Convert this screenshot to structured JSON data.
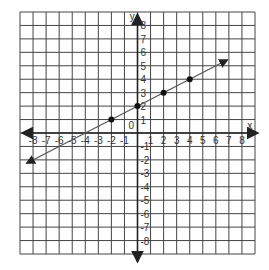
{
  "chart_data": {
    "type": "line",
    "title": "",
    "xlabel": "x",
    "ylabel": "y",
    "xlim": [
      -9,
      9
    ],
    "ylim": [
      -9,
      9
    ],
    "grid": true,
    "x_ticks": [
      -8,
      -7,
      -6,
      -5,
      -4,
      -3,
      -2,
      -1,
      1,
      2,
      3,
      4,
      5,
      6,
      7,
      8
    ],
    "y_ticks": [
      8,
      7,
      6,
      5,
      4,
      3,
      2,
      1,
      -1,
      -2,
      -3,
      -4,
      -5,
      -6,
      -7,
      -8
    ],
    "origin_label": "0",
    "line": {
      "slope": 0.5,
      "intercept": 2,
      "from": [
        -8.5,
        -2.25
      ],
      "to": [
        6.9,
        5.45
      ],
      "arrows": "both"
    },
    "points": [
      {
        "x": -2,
        "y": 1
      },
      {
        "x": 0,
        "y": 2
      },
      {
        "x": 2,
        "y": 3
      },
      {
        "x": 4,
        "y": 4
      }
    ],
    "colors": {
      "grid": "#444444",
      "axis": "#222222",
      "line": "#555555",
      "point": "#111111"
    }
  }
}
